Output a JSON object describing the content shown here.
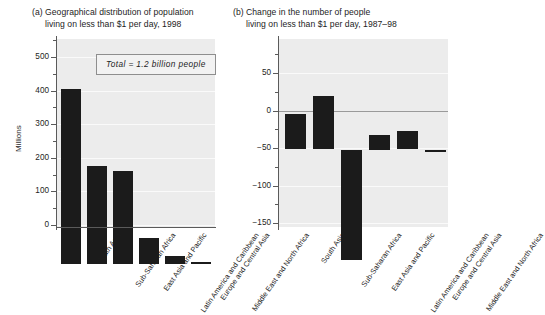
{
  "figure": {
    "panel_a": {
      "tag": "(a)",
      "title_line1": "Geographical distribution of population",
      "title_line2": "living on less than $1 per day, 1998",
      "ylabel": "Millions",
      "annotation": "Total  =  1.2 billion people"
    },
    "panel_b": {
      "tag": "(b)",
      "title_line1": "Change in the number of people",
      "title_line2": "living on less than $1 per day, 1987–98"
    }
  },
  "chart_data": [
    {
      "type": "bar",
      "title": "(a) Geographical distribution of population living on less than $1 per day, 1998",
      "xlabel": "",
      "ylabel": "Millions",
      "ylim": [
        0,
        560
      ],
      "yticks": [
        0,
        100,
        200,
        300,
        400,
        500
      ],
      "yticklabels": [
        "0",
        "100",
        "200",
        "300",
        "400",
        "500"
      ],
      "minor_tick_step": 50,
      "grid": true,
      "legend": false,
      "annotation": "Total  =  1.2 billion people",
      "categories": [
        "South Asia",
        "Sub-Saharan Africa",
        "East Asia and Pacific",
        "Latin America and Caribbean",
        "Europe and Central Asia",
        "Middle East and North Africa"
      ],
      "values": [
        522,
        291,
        278,
        78,
        24,
        6
      ],
      "bar_color": "#1b1b1b"
    },
    {
      "type": "bar",
      "title": "(b) Change in the number of people living on less than $1 per day, 1987–98",
      "xlabel": "",
      "ylabel": "",
      "ylim": [
        -150,
        82
      ],
      "yticks": [
        50,
        0,
        -50,
        -100,
        -150
      ],
      "yticklabels": [
        "50",
        "0",
        "−50",
        "−100",
        "−150"
      ],
      "minor_tick_step": 25,
      "grid": true,
      "legend": false,
      "categories": [
        "South Asia",
        "Sub-Saharan Africa",
        "East Asia and Pacific",
        "Latin America and Caribbean",
        "Europe and Central Asia",
        "Middle East and North Africa"
      ],
      "values": [
        47,
        71,
        -147,
        20,
        25,
        -3
      ],
      "bar_color": "#1b1b1b"
    }
  ],
  "ticks_a": [
    {
      "label": "500",
      "y": 57.0
    },
    {
      "label": "400",
      "y": 90.6
    },
    {
      "label": "300",
      "y": 124.2
    },
    {
      "label": "200",
      "y": 157.8
    },
    {
      "label": "100",
      "y": 191.4
    },
    {
      "label": "0",
      "y": 225.0
    }
  ],
  "minor_ticks_a": [
    73.8,
    107.4,
    141.0,
    174.6,
    208.2,
    40.2
  ],
  "ticks_b": [
    {
      "label": "50",
      "y": 73.0
    },
    {
      "label": "0",
      "y": 110.5
    },
    {
      "label": "−50",
      "y": 148.0
    },
    {
      "label": "−100",
      "y": 185.5
    },
    {
      "label": "−150",
      "y": 223.0
    }
  ],
  "minor_ticks_b": [
    54.2,
    91.8,
    129.2,
    166.8,
    204.2
  ],
  "bars_a": [
    {
      "name": "South Asia",
      "left": 4,
      "width": 20,
      "top": 49.6,
      "height": 175.4
    },
    {
      "name": "Sub-Saharan Africa",
      "left": 30,
      "width": 20,
      "top": 127.2,
      "height": 97.8
    },
    {
      "name": "East Asia and Pacific",
      "left": 56,
      "width": 20,
      "top": 131.6,
      "height": 93.4
    },
    {
      "name": "Latin America and Caribbean",
      "left": 82,
      "width": 20,
      "top": 198.8,
      "height": 26.2
    },
    {
      "name": "Europe and Central Asia",
      "left": 108,
      "width": 20,
      "top": 216.9,
      "height": 8.1
    },
    {
      "name": "Middle East and North Africa",
      "left": 134,
      "width": 20,
      "top": 223.0,
      "height": 2.0
    }
  ],
  "bars_b": [
    {
      "name": "South Asia",
      "left": 6,
      "width": 21,
      "top": 75.2,
      "height": 35.3
    },
    {
      "name": "Sub-Saharan Africa",
      "left": 34,
      "width": 21,
      "top": 57.2,
      "height": 53.3
    },
    {
      "name": "East Asia and Pacific",
      "left": 62,
      "width": 21,
      "top": 110.5,
      "height": 110.2
    },
    {
      "name": "Latin America and Caribbean",
      "left": 90,
      "width": 21,
      "top": 95.5,
      "height": 15.0
    },
    {
      "name": "Europe and Central Asia",
      "left": 118,
      "width": 21,
      "top": 91.8,
      "height": 18.7
    },
    {
      "name": "Middle East and North Africa",
      "left": 146,
      "width": 21,
      "top": 110.5,
      "height": 2.3
    }
  ],
  "catlabels_a": [
    {
      "text": "South Asia",
      "x": 80
    },
    {
      "text": "Sub-Saharan Africa",
      "x": 106
    },
    {
      "text": "East Asia and Pacific",
      "x": 132
    },
    {
      "text": "Latin America and Caribbean",
      "x": 158
    },
    {
      "text": "Europe and Central Asia",
      "x": 184
    },
    {
      "text": "Middle East and North Africa",
      "x": 210
    }
  ],
  "catlabels_b": [
    {
      "text": "South Asia",
      "x": 76
    },
    {
      "text": "Sub-Saharan Africa",
      "x": 104
    },
    {
      "text": "East Asia and Pacific",
      "x": 132
    },
    {
      "text": "Latin America and Caribbean",
      "x": 160
    },
    {
      "text": "Europe and Central Asia",
      "x": 188
    },
    {
      "text": "Middle East and North Africa",
      "x": 216
    }
  ]
}
